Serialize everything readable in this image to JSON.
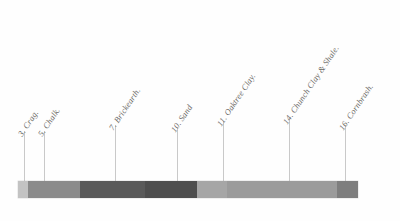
{
  "figure": {
    "background_color": "#fefefe",
    "bar": {
      "left": 18,
      "top": 181,
      "width": 340,
      "height": 17
    }
  },
  "chart_data": {
    "type": "bar",
    "title": "",
    "xlabel": "",
    "ylabel": "",
    "orientation": "horizontal-stacked-key",
    "categories": [
      "3. Crag.",
      "5. Chalk.",
      "7. Brickearth.",
      "10. Sand",
      "11. Oaktree Clay.",
      "14. Chunch Clay & Shale.",
      "16. Cornbrash."
    ],
    "segments": [
      {
        "label": "3. Crag.",
        "color": "#c3c3c3",
        "start": 0,
        "width": 10
      },
      {
        "label": "5. Chalk.",
        "color": "#8b8b8b",
        "start": 10,
        "width": 52
      },
      {
        "label": "7. Brickearth.",
        "color": "#5a5a5a",
        "start": 62,
        "width": 65
      },
      {
        "label": "10. Sand",
        "color": "#4e4e4e",
        "start": 127,
        "width": 52
      },
      {
        "label": "11. Oaktree Clay.",
        "color": "#a6a6a6",
        "start": 179,
        "width": 30
      },
      {
        "label": "14. Chunch Clay & Shale.",
        "color": "#9b9b9b",
        "start": 209,
        "width": 110
      },
      {
        "label": "16. Cornbrash.",
        "color": "#7e7e7e",
        "start": 319,
        "width": 21
      }
    ],
    "values": [
      10,
      52,
      65,
      52,
      30,
      110,
      21
    ],
    "grid": false,
    "legend_position": "above-bar-angled"
  },
  "labels": [
    {
      "text": "3. Crag.",
      "x": 24,
      "label_y": 128,
      "line_top": 131,
      "line_bottom": 181
    },
    {
      "text": "5. Chalk.",
      "x": 44,
      "label_y": 128,
      "line_top": 131,
      "line_bottom": 181
    },
    {
      "text": "7. Brickearth.",
      "x": 115,
      "label_y": 122,
      "line_top": 125,
      "line_bottom": 181
    },
    {
      "text": "10. Sand",
      "x": 177,
      "label_y": 124,
      "line_top": 127,
      "line_bottom": 181
    },
    {
      "text": "11. Oaktree Clay.",
      "x": 223,
      "label_y": 118,
      "line_top": 121,
      "line_bottom": 181
    },
    {
      "text": "14. Chunch Clay & Shale.",
      "x": 289,
      "label_y": 116,
      "line_top": 119,
      "line_bottom": 181
    },
    {
      "text": "16. Cornbrash.",
      "x": 345,
      "label_y": 122,
      "line_top": 125,
      "line_bottom": 181
    }
  ],
  "style": {
    "label_color": "#6d6a66",
    "leader_color": "#c9c9c9",
    "rotation_degrees": -56
  }
}
